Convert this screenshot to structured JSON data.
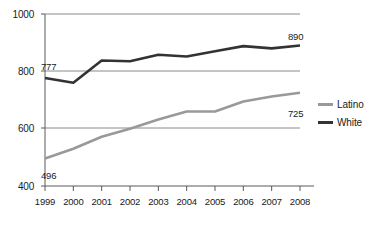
{
  "chart_data": {
    "type": "line",
    "title": "",
    "subtitle": "",
    "xlabel": "",
    "ylabel": "",
    "categories": [
      "1999",
      "2000",
      "2001",
      "2002",
      "2003",
      "2004",
      "2005",
      "2006",
      "2007",
      "2008"
    ],
    "x": [
      1999,
      2000,
      2001,
      2002,
      2003,
      2004,
      2005,
      2006,
      2007,
      2008
    ],
    "ylim": [
      400,
      1000
    ],
    "yticks": [
      400,
      600,
      800,
      1000
    ],
    "ytick_labels": [
      "400",
      "600",
      "800",
      "1000"
    ],
    "grid": true,
    "grid_axis": "y",
    "legend_position": "right",
    "series": [
      {
        "name": "Latino",
        "color": "#999999",
        "values": [
          496,
          530,
          572,
          600,
          632,
          660,
          660,
          695,
          712,
          725
        ],
        "point_labels": [
          {
            "index": 0,
            "text": "496"
          },
          {
            "index": 9,
            "text": "725"
          }
        ]
      },
      {
        "name": "White",
        "color": "#333333",
        "values": [
          777,
          760,
          838,
          835,
          858,
          852,
          870,
          888,
          880,
          890
        ],
        "point_labels": [
          {
            "index": 0,
            "text": "777"
          },
          {
            "index": 9,
            "text": "890"
          }
        ]
      }
    ],
    "annotations": [
      {
        "text": "777",
        "series": "White",
        "year": "1999"
      },
      {
        "text": "890",
        "series": "White",
        "year": "2008"
      },
      {
        "text": "496",
        "series": "Latino",
        "year": "1999"
      },
      {
        "text": "725",
        "series": "Latino",
        "year": "2008"
      }
    ],
    "legend": [
      {
        "label": "Latino",
        "color": "#999999"
      },
      {
        "label": "White",
        "color": "#333333"
      }
    ]
  }
}
